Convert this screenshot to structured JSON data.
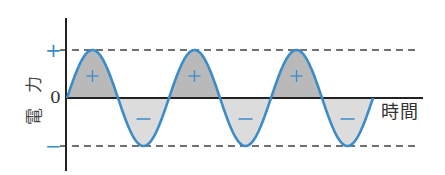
{
  "diagram": {
    "y_axis_label": [
      "電",
      "力"
    ],
    "x_axis_label": "時間",
    "tick_labels": {
      "plus": "+",
      "zero": "0",
      "minus": "−"
    },
    "lobe_markers": {
      "positive": "+",
      "negative": "−"
    },
    "cycles": 3,
    "colors": {
      "curve": "#3b8cc9",
      "positive_fill": "#b9b9b9",
      "negative_fill": "#dcdcdc",
      "axis": "#222222",
      "dashed": "#444444",
      "marker": "#3b8cc9"
    }
  }
}
